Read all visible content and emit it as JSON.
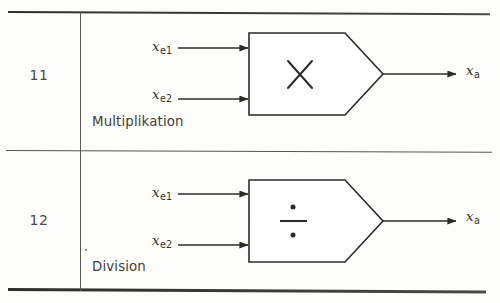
{
  "document": {
    "kind": "technical-symbol-table",
    "language": "de"
  },
  "table": {
    "rows": [
      {
        "number": "11",
        "caption": "Multiplikation",
        "symbol": "multiplication-cross",
        "symbol_glyph": "×",
        "inputs": [
          {
            "base": "x",
            "sub": "e1"
          },
          {
            "base": "x",
            "sub": "e2"
          }
        ],
        "output": {
          "base": "x",
          "sub": "a"
        }
      },
      {
        "number": "12",
        "caption": "Division",
        "symbol": "division-obelus",
        "symbol_glyph": "÷",
        "inputs": [
          {
            "base": "x",
            "sub": "e1"
          },
          {
            "base": "x",
            "sub": "e2"
          }
        ],
        "output": {
          "base": "x",
          "sub": "a"
        }
      }
    ]
  },
  "colors": {
    "ink": "#2b2b2b",
    "rule": "#3a3a38",
    "paper": "#fdfdfc"
  }
}
